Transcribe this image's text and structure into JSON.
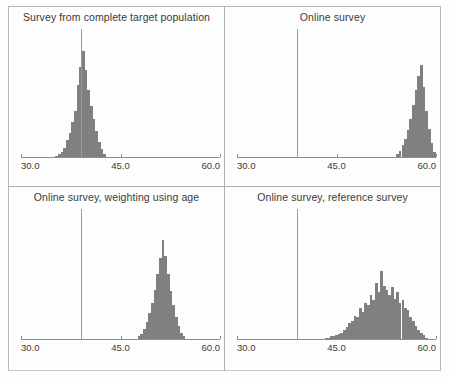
{
  "figure": {
    "layout": "2x2 grid of histogram panels",
    "bar_color": "#808080",
    "refline_color": "#9a9a9a",
    "axis_color": "#8d8d8d",
    "frame_color": "#b0b0b0"
  },
  "chart_data": [
    {
      "type": "bar",
      "panel_index": 0,
      "title": "Survey from complete target population",
      "xlabel": "",
      "ylabel": "",
      "xlim": [
        30.0,
        60.0
      ],
      "ylim": [
        0,
        100
      ],
      "grid": false,
      "legend": null,
      "xticks": [
        30.0,
        45.0,
        60.0
      ],
      "xticklabels": [
        "30.0",
        "45.0",
        "60.0"
      ],
      "reference_line_x": 39.0,
      "reference_line_height_pct": 100,
      "bin_width": 0.4,
      "bins": [
        35.2,
        35.6,
        36.0,
        36.4,
        36.8,
        37.2,
        37.6,
        38.0,
        38.4,
        38.8,
        39.2,
        39.6,
        40.0,
        40.4,
        40.8,
        41.2,
        41.6,
        42.0,
        42.4
      ],
      "values": [
        1,
        2,
        4,
        7,
        13,
        19,
        27,
        36,
        56,
        70,
        83,
        68,
        52,
        40,
        30,
        20,
        12,
        6,
        2
      ]
    },
    {
      "type": "bar",
      "panel_index": 1,
      "title": "Online survey",
      "xlabel": "",
      "ylabel": "",
      "xlim": [
        30.0,
        60.0
      ],
      "ylim": [
        0,
        100
      ],
      "grid": false,
      "legend": null,
      "xticks": [
        30.0,
        45.0,
        60.0
      ],
      "xticklabels": [
        "30.0",
        "45.0",
        "60.0"
      ],
      "reference_line_x": 39.0,
      "reference_line_height_pct": 100,
      "bin_width": 0.4,
      "bins": [
        54.0,
        54.4,
        54.8,
        55.2,
        55.6,
        56.0,
        56.4,
        56.8,
        57.2,
        57.6,
        58.0,
        58.4,
        58.8,
        59.2,
        59.6
      ],
      "values": [
        2,
        5,
        9,
        14,
        21,
        30,
        41,
        52,
        63,
        72,
        55,
        36,
        22,
        11,
        4
      ]
    },
    {
      "type": "bar",
      "panel_index": 2,
      "title": "Online survey, weighting using age",
      "xlabel": "",
      "ylabel": "",
      "xlim": [
        30.0,
        60.0
      ],
      "ylim": [
        0,
        100
      ],
      "grid": false,
      "legend": null,
      "xticks": [
        30.0,
        45.0,
        60.0
      ],
      "xticklabels": [
        "30.0",
        "45.0",
        "60.0"
      ],
      "reference_line_x": 39.0,
      "reference_line_height_pct": 100,
      "bin_width": 0.4,
      "bins": [
        47.6,
        48.0,
        48.4,
        48.8,
        49.2,
        49.6,
        50.0,
        50.4,
        50.8,
        51.2,
        51.6,
        52.0,
        52.4,
        52.8,
        53.2,
        53.6,
        54.0,
        54.4
      ],
      "values": [
        2,
        4,
        8,
        13,
        20,
        28,
        38,
        50,
        62,
        76,
        64,
        50,
        37,
        26,
        17,
        10,
        5,
        2
      ]
    },
    {
      "type": "bar",
      "panel_index": 3,
      "title": "Online survey, reference survey",
      "xlabel": "",
      "ylabel": "",
      "xlim": [
        30.0,
        60.0
      ],
      "ylim": [
        0,
        100
      ],
      "grid": false,
      "legend": null,
      "xticks": [
        30.0,
        45.0,
        60.0
      ],
      "xticklabels": [
        "30.0",
        "45.0",
        "60.0"
      ],
      "reference_line_x": 39.0,
      "reference_line_height_pct": 100,
      "bin_width": 0.4,
      "bins": [
        43.2,
        43.6,
        44.0,
        44.4,
        44.8,
        45.2,
        45.6,
        46.0,
        46.4,
        46.8,
        47.2,
        47.6,
        48.0,
        48.4,
        48.8,
        49.2,
        49.6,
        50.0,
        50.4,
        50.8,
        51.2,
        51.6,
        52.0,
        52.4,
        52.8,
        53.2,
        53.6,
        54.0,
        54.4,
        54.8,
        55.2,
        55.6,
        56.0,
        56.4,
        56.8,
        57.2,
        57.6,
        58.0,
        58.4
      ],
      "values": [
        1,
        1,
        2,
        2,
        3,
        4,
        5,
        7,
        9,
        12,
        14,
        18,
        17,
        24,
        21,
        28,
        26,
        34,
        30,
        43,
        36,
        52,
        41,
        38,
        34,
        40,
        31,
        36,
        28,
        30,
        24,
        22,
        17,
        14,
        10,
        7,
        5,
        3,
        1
      ]
    }
  ]
}
